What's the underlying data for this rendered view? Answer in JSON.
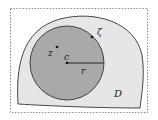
{
  "diagram": {
    "labels": {
      "region": "D",
      "boundary_point": "ζ",
      "interior_point": "z",
      "center": "c",
      "radius": "r"
    },
    "colors": {
      "region_fill": "#e6e6e6",
      "disk_fill": "#a9a9a9",
      "stroke": "#333333",
      "frame": "#888888"
    }
  }
}
